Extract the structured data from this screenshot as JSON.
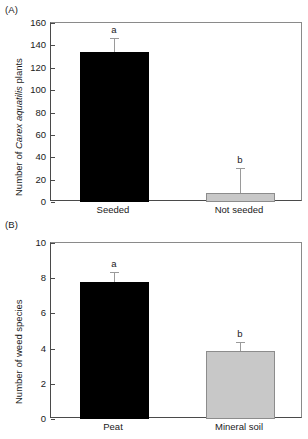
{
  "figure": {
    "background": "#ffffff",
    "bar_colors": {
      "black": "#000000",
      "gray": "#c8c8c8",
      "gray_edge": "#8c8c8c"
    },
    "errorbar_color": "#9a9a9a",
    "axis_color": "#4a4a4a"
  },
  "panels": [
    {
      "tag": "(A)",
      "ylabel_prefix": "Number of ",
      "ylabel_italic": "Carex aquatilis",
      "ylabel_suffix": " plants",
      "yticks": [
        "0",
        "20",
        "40",
        "60",
        "80",
        "100",
        "120",
        "140",
        "160"
      ],
      "xticks": [
        "Seeded",
        "Not seeded"
      ],
      "letters": [
        "a",
        "b"
      ]
    },
    {
      "tag": "(B)",
      "ylabel_prefix": "Number of weed species",
      "ylabel_italic": "",
      "ylabel_suffix": "",
      "yticks": [
        "0",
        "2",
        "4",
        "6",
        "8",
        "10"
      ],
      "xticks": [
        "Peat",
        "Mineral soil"
      ],
      "letters": [
        "a",
        "b"
      ]
    }
  ],
  "chart_data": [
    {
      "type": "bar",
      "panel": "(A)",
      "title": "",
      "xlabel": "",
      "ylabel": "Number of Carex aquatilis plants",
      "categories": [
        "Seeded",
        "Not seeded"
      ],
      "values": [
        134,
        8
      ],
      "errors": [
        13,
        22
      ],
      "error_type": "upper-only",
      "bar_colors": [
        "#000000",
        "#c8c8c8"
      ],
      "significance_letters": [
        "a",
        "b"
      ],
      "ylim": [
        0,
        160
      ],
      "ytick_values": [
        0,
        20,
        40,
        60,
        80,
        100,
        120,
        140,
        160
      ],
      "grid": false,
      "legend": "none"
    },
    {
      "type": "bar",
      "panel": "(B)",
      "title": "",
      "xlabel": "",
      "ylabel": "Number of weed species",
      "categories": [
        "Peat",
        "Mineral soil"
      ],
      "values": [
        7.8,
        3.85
      ],
      "errors": [
        0.55,
        0.5
      ],
      "error_type": "upper-only",
      "bar_colors": [
        "#000000",
        "#c8c8c8"
      ],
      "significance_letters": [
        "a",
        "b"
      ],
      "ylim": [
        0,
        10
      ],
      "ytick_values": [
        0,
        2,
        4,
        6,
        8,
        10
      ],
      "grid": false,
      "legend": "none"
    }
  ]
}
